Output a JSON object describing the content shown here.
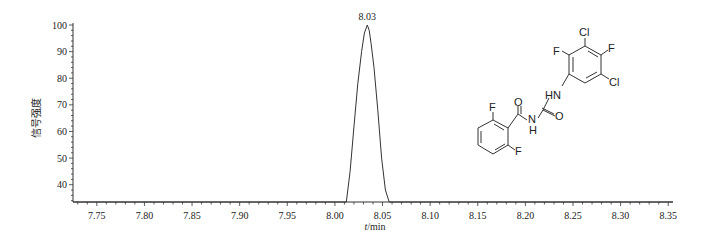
{
  "chart_data": {
    "type": "line",
    "title": "",
    "xlabel": "t/min",
    "ylabel": "信号强度",
    "xlim": [
      7.725,
      8.355
    ],
    "ylim": [
      33.5,
      100
    ],
    "x_ticks": [
      7.75,
      7.8,
      7.85,
      7.9,
      7.95,
      8.0,
      8.05,
      8.1,
      8.15,
      8.2,
      8.25,
      8.3,
      8.35
    ],
    "x_tick_labels": [
      "7.75",
      "7.80",
      "7.85",
      "7.90",
      "7.95",
      "8.00",
      "8.05",
      "8.10",
      "8.15",
      "8.20",
      "8.25",
      "8.30",
      "8.35"
    ],
    "y_ticks": [
      40,
      50,
      60,
      70,
      80,
      90,
      100
    ],
    "y_tick_labels": [
      "40",
      "50",
      "60",
      "70",
      "80",
      "90",
      "100"
    ],
    "grid": false,
    "legend": null,
    "series": [
      {
        "name": "chromatogram",
        "x": [
          7.725,
          8.012,
          8.016,
          8.02,
          8.024,
          8.028,
          8.031,
          8.034,
          8.036,
          8.038,
          8.041,
          8.045,
          8.049,
          8.053,
          8.057,
          8.355
        ],
        "y": [
          33.5,
          33.5,
          45,
          62,
          78,
          90,
          97,
          100,
          98,
          93,
          84,
          68,
          50,
          38,
          33.5,
          33.5
        ]
      }
    ],
    "annotations": [
      {
        "text": "8.03",
        "x": 8.034,
        "y": 100,
        "type": "peak-label"
      }
    ]
  },
  "molecule": {
    "labels": {
      "cl_top": "Cl",
      "f_top": "F",
      "f_left": "F",
      "cl_right": "Cl",
      "nh_upper": "HN",
      "o_urea": "O",
      "o_amide": "O",
      "n_lower": "N",
      "h_lower": "H",
      "f_benz_top": "F",
      "f_benz_bottom": "F"
    }
  }
}
